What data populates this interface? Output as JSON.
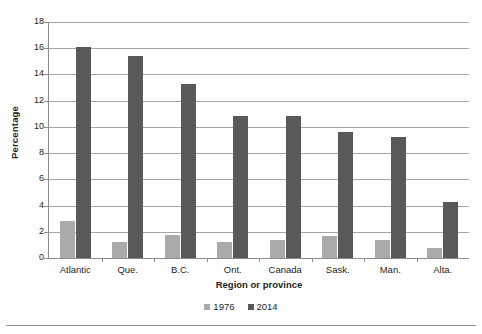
{
  "chart_data": {
    "type": "bar",
    "title": "",
    "xlabel": "Region or province",
    "ylabel": "Percentage",
    "categories": [
      "Atlantic",
      "Que.",
      "B.C.",
      "Ont.",
      "Canada",
      "Sask.",
      "Man.",
      "Alta."
    ],
    "series": [
      {
        "name": "1976",
        "color": "#aaaaaa",
        "values": [
          2.8,
          1.2,
          1.75,
          1.2,
          1.4,
          1.7,
          1.4,
          0.75
        ]
      },
      {
        "name": "2014",
        "color": "#595959",
        "values": [
          16.1,
          15.4,
          13.3,
          10.8,
          10.8,
          9.6,
          9.2,
          4.3
        ]
      }
    ],
    "ylim": [
      0,
      18
    ],
    "yticks": [
      0,
      2,
      4,
      6,
      8,
      10,
      12,
      14,
      16,
      18
    ],
    "ytick_labels": [
      "0",
      "2",
      "4",
      "6",
      "8",
      "10",
      "12",
      "14",
      "16",
      "18"
    ],
    "grid": true,
    "legend_position": "bottom"
  },
  "legend": {
    "items": [
      {
        "label": "1976",
        "color": "#aaaaaa"
      },
      {
        "label": "2014",
        "color": "#595959"
      }
    ]
  },
  "axes": {
    "y_title": "Percentage",
    "x_title": "Region or province"
  }
}
